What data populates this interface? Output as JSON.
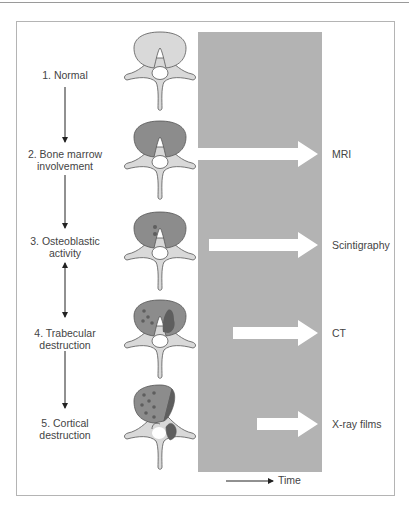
{
  "diagram": {
    "title": "",
    "stages": [
      {
        "label": "1. Normal",
        "vertebra": "normal"
      },
      {
        "label": "2. Bone marrow involvement",
        "line1": "2. Bone marrow",
        "line2": "involvement",
        "vertebra": "marrow-involved"
      },
      {
        "label": "3. Osteoblastic activity",
        "line1": "3. Osteoblastic",
        "line2": "activity",
        "vertebra": "osteoblastic"
      },
      {
        "label": "4. Trabecular destruction",
        "line1": "4. Trabecular",
        "line2": "destruction",
        "vertebra": "trabecular-destruction"
      },
      {
        "label": "5. Cortical destruction",
        "line1": "5. Cortical",
        "line2": "destruction",
        "vertebra": "cortical-destruction"
      }
    ],
    "stage_connectors": [
      "down-arrow",
      "down-arrow",
      "double-arrow",
      "down-arrow"
    ],
    "modalities": [
      {
        "label": "MRI",
        "detects_at_stage": 2
      },
      {
        "label": "Scintigraphy",
        "detects_at_stage": 3
      },
      {
        "label": "CT",
        "detects_at_stage": 4
      },
      {
        "label": "X-ray films",
        "detects_at_stage": 5
      }
    ],
    "time_axis_label": "Time",
    "colors": {
      "panel": "#b3b3b3",
      "bone_normal": "#d9d9d9",
      "marrow_involved": "#8c8c8c",
      "lesion": "#5e5e5e",
      "arrow_fill": "#ffffff",
      "frame": "#b4b4b4"
    }
  }
}
